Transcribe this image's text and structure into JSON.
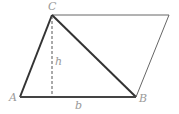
{
  "diagram": {
    "type": "geometry-parallelogram-triangle",
    "vertices": {
      "A": {
        "label": "A",
        "x": 20,
        "y": 97
      },
      "B": {
        "label": "B",
        "x": 136,
        "y": 97
      },
      "C": {
        "label": "C",
        "x": 52,
        "y": 15
      },
      "D": {
        "x": 169,
        "y": 15
      }
    },
    "labels": {
      "A": "A",
      "B": "B",
      "C": "C",
      "height": "h",
      "base": "b"
    },
    "colors": {
      "triangle_stroke": "#333333",
      "parallelogram_stroke": "#666666",
      "dashed_height": "#555555",
      "label": "#9a9a9a"
    }
  }
}
